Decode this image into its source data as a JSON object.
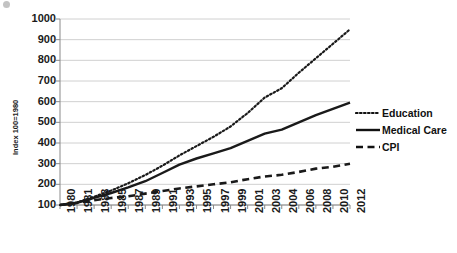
{
  "chart_data": {
    "type": "line",
    "title": "",
    "xlabel": "",
    "ylabel": "Index 100=1980",
    "ylim": [
      100,
      1000
    ],
    "ytick_step": 100,
    "grid": true,
    "legend_position": "right",
    "yticks": [
      1000,
      900,
      800,
      700,
      600,
      500,
      400,
      300,
      200,
      100
    ],
    "categories": [
      "1980",
      "1981",
      "1983",
      "1985",
      "1987",
      "1989",
      "1991",
      "1993",
      "1995",
      "1997",
      "1999",
      "2001",
      "2003",
      "2004",
      "2006",
      "2008",
      "2010",
      "2012"
    ],
    "series": [
      {
        "name": "Education",
        "style": "dotted",
        "color": "#1a1a1a",
        "values": [
          100,
          112,
          140,
          170,
          205,
          245,
          290,
          340,
          385,
          430,
          480,
          545,
          620,
          665,
          740,
          810,
          880,
          950
        ]
      },
      {
        "name": "Medical Care",
        "style": "solid",
        "color": "#1a1a1a",
        "values": [
          100,
          111,
          135,
          158,
          185,
          215,
          255,
          295,
          325,
          350,
          375,
          410,
          445,
          465,
          500,
          535,
          565,
          595
        ]
      },
      {
        "name": "CPI",
        "style": "dashed",
        "color": "#1a1a1a",
        "values": [
          100,
          110,
          123,
          134,
          142,
          155,
          168,
          180,
          190,
          200,
          210,
          225,
          238,
          246,
          260,
          276,
          285,
          300
        ]
      }
    ]
  },
  "legend": {
    "items": [
      {
        "label": "Education",
        "style": "dotted"
      },
      {
        "label": "Medical Care",
        "style": "solid"
      },
      {
        "label": "CPI",
        "style": "dashed"
      }
    ]
  },
  "axes": {
    "y_title": "Index 100=1980"
  }
}
